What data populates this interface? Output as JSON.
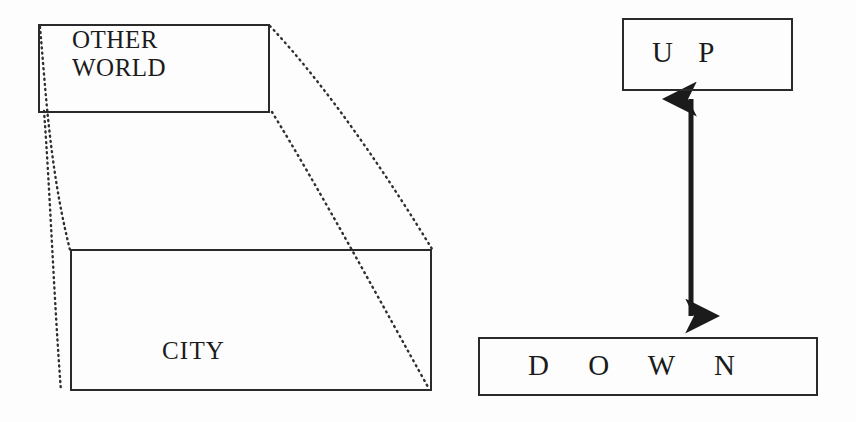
{
  "figure": {
    "background_color": "#fdfdfd",
    "stroke_color": "#2a2a2a",
    "text_color": "#1b1b1b",
    "width": 856,
    "height": 422
  },
  "diagram": {
    "left_cluster": {
      "name": "perspective-boxes",
      "nodes": [
        {
          "id": "other-world",
          "label": "OTHER\nWORLD",
          "x": 38,
          "y": 24,
          "w": 232,
          "h": 89,
          "border": "solid"
        },
        {
          "id": "city",
          "label": "CITY",
          "x": 70,
          "y": 249,
          "w": 362,
          "h": 142,
          "border": "solid"
        }
      ],
      "connectors": [
        {
          "id": "conn-top-left",
          "style": "dotted",
          "from": [
            40,
            27
          ],
          "to": [
            70,
            250
          ]
        },
        {
          "id": "conn-bottom-left",
          "style": "dotted",
          "from": [
            44,
            111
          ],
          "to": [
            61,
            391
          ]
        },
        {
          "id": "conn-top-right",
          "style": "dotted",
          "from": [
            270,
            26
          ],
          "to": [
            432,
            249
          ]
        },
        {
          "id": "conn-bottom-right",
          "style": "dotted",
          "from": [
            272,
            112
          ],
          "to": [
            428,
            387
          ]
        }
      ]
    },
    "right_cluster": {
      "name": "up-down-boxes",
      "nodes": [
        {
          "id": "up",
          "label": "U P",
          "x": 622,
          "y": 18,
          "w": 171,
          "h": 73,
          "border": "solid"
        },
        {
          "id": "down",
          "label": "D O W N",
          "x": 478,
          "y": 337,
          "w": 340,
          "h": 59,
          "border": "solid"
        }
      ],
      "connectors": [
        {
          "id": "double-arrow",
          "style": "solid",
          "arrowheads": "both",
          "from": [
            691,
            95
          ],
          "to": [
            691,
            320
          ]
        }
      ]
    }
  }
}
